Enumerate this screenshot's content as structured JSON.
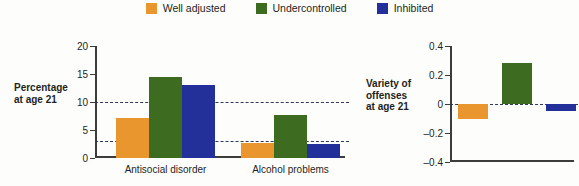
{
  "legend": {
    "items": [
      {
        "label": "Well adjusted",
        "color": "#e8962d",
        "key": "well_adjusted"
      },
      {
        "label": "Undercontrolled",
        "color": "#3d6b1f",
        "key": "undercontrolled"
      },
      {
        "label": "Inhibited",
        "color": "#24309a",
        "key": "inhibited"
      }
    ]
  },
  "chart_data": [
    {
      "id": "percentage-at-age-21",
      "type": "bar",
      "title": "",
      "ylabel": "Percentage at age 21",
      "ylabel_lines": [
        "Percentage",
        "at age 21"
      ],
      "xlabel": "",
      "categories": [
        "Antisocial disorder",
        "Alcohol problems"
      ],
      "ylim": [
        0,
        20
      ],
      "yticks": [
        0,
        5,
        10,
        15,
        20
      ],
      "ytick_labels": [
        "0",
        "5",
        "10",
        "15",
        "20"
      ],
      "grid": false,
      "reference_lines": [
        10,
        3
      ],
      "legend_position": "top-center",
      "series": [
        {
          "name": "Well adjusted",
          "color": "#e8962d",
          "values": [
            7.2,
            2.7
          ]
        },
        {
          "name": "Undercontrolled",
          "color": "#3d6b1f",
          "values": [
            14.5,
            7.7
          ]
        },
        {
          "name": "Inhibited",
          "color": "#24309a",
          "values": [
            13.0,
            2.5
          ]
        }
      ]
    },
    {
      "id": "variety-of-offenses-at-age-21",
      "type": "bar",
      "title": "",
      "ylabel": "Variety of offenses at age 21",
      "ylabel_lines": [
        "Variety of",
        "offenses",
        "at age 21"
      ],
      "xlabel": "",
      "categories": [
        ""
      ],
      "ylim": [
        -0.4,
        0.4
      ],
      "yticks": [
        -0.4,
        -0.2,
        0,
        0.2,
        0.4
      ],
      "ytick_labels": [
        "–0.4",
        "–0.2",
        "0",
        "0.2",
        "0.4"
      ],
      "grid": false,
      "reference_lines": [
        0
      ],
      "legend_position": "top-center",
      "series": [
        {
          "name": "Well adjusted",
          "color": "#e8962d",
          "values": [
            -0.1
          ]
        },
        {
          "name": "Undercontrolled",
          "color": "#3d6b1f",
          "values": [
            0.28
          ]
        },
        {
          "name": "Inhibited",
          "color": "#24309a",
          "values": [
            -0.05
          ]
        }
      ]
    }
  ]
}
